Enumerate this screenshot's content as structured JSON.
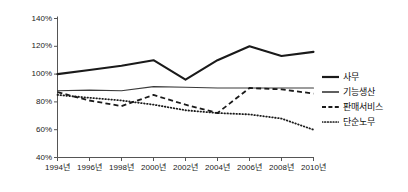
{
  "chart_data": {
    "type": "line",
    "title": "",
    "xlabel": "",
    "ylabel": "",
    "categories": [
      "1994년",
      "1996년",
      "1998년",
      "2000년",
      "2002년",
      "2004년",
      "2006년",
      "2008년",
      "2010년"
    ],
    "ylim": [
      40,
      140
    ],
    "yticks": [
      40,
      60,
      80,
      100,
      120,
      140
    ],
    "ytick_labels": [
      "40%",
      "60%",
      "80%",
      "100%",
      "120%",
      "140%"
    ],
    "grid": false,
    "legend_position": "right",
    "series": [
      {
        "name": "사무",
        "style": "solid",
        "width": 2.1,
        "color": "#1a1a1a",
        "values": [
          100,
          103,
          106,
          110,
          96,
          110,
          120,
          113,
          116
        ]
      },
      {
        "name": "기능생산",
        "style": "solid",
        "width": 1.1,
        "color": "#3a3a3a",
        "values": [
          88,
          88.5,
          88,
          91,
          90.5,
          90,
          90,
          90,
          90
        ]
      },
      {
        "name": "판매서비스",
        "style": "dashed",
        "width": 1.8,
        "color": "#1a1a1a",
        "values": [
          87,
          81,
          77,
          85,
          78,
          72,
          90,
          89,
          86
        ]
      },
      {
        "name": "단순노무",
        "style": "dotted",
        "width": 1.8,
        "color": "#1a1a1a",
        "values": [
          85,
          83,
          81,
          78,
          74,
          72,
          71,
          68,
          60
        ]
      }
    ]
  },
  "axes": {
    "y_labels": [
      "140%",
      "120%",
      "100%",
      "80%",
      "60%",
      "40%"
    ],
    "x_labels": [
      "1994년",
      "1996년",
      "1998년",
      "2000년",
      "2002년",
      "2004년",
      "2006년",
      "2008년",
      "2010년"
    ]
  },
  "legend": {
    "items": [
      {
        "label": "사무",
        "style": "solid-thick"
      },
      {
        "label": "기능생산",
        "style": "solid-thin"
      },
      {
        "label": "판매서비스",
        "style": "dashed"
      },
      {
        "label": "단순노무",
        "style": "dotted"
      }
    ]
  },
  "colors": {
    "axis": "#555555",
    "ink": "#1a1a1a",
    "background": "#ffffff"
  }
}
